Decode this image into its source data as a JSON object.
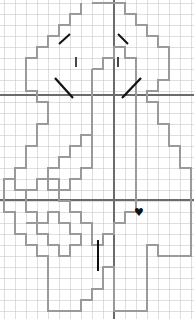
{
  "canvas": {
    "width": 194,
    "height": 319,
    "background": "#ffffff"
  },
  "grid": {
    "cell_size": 11,
    "origin_x": 4,
    "origin_y": 3,
    "minor_color": "#c9c9c9",
    "minor_width": 0.6,
    "major_color": "#6b6b6b",
    "major_width": 1.1,
    "major_vertical_x": 114,
    "major_horizontal_y": [
      95,
      200
    ]
  },
  "outline": {
    "name": "pixel-figure-outline",
    "stroke": "#9a9a9a",
    "stroke_width": 1.6,
    "fill": "none",
    "description": "blocky stair-stepped silhouette of a head, torso and legs",
    "points": "92,3 125,3 125,14 136,14 136,25 147,25 147,36 158,36 158,47 169,47 169,80 158,80 158,91 147,91 147,102 158,102 158,113 158,124 169,124 169,146 180,146 180,168 191,168 191,179 191,190 191,256 158,256 158,245 147,245 147,256 147,267 147,278 147,289 147,300 147,311 114,311 114,300 114,289 114,278 114,267 103,267 103,278 103,289 92,289 92,300 81,300 81,311 48,311 48,300 48,289 48,278 48,267 48,256 37,256 37,245 26,245 26,234 15,234 15,223 15,212 4,212 4,201 4,190 4,179 15,179 15,168 26,168 26,157 26,146 37,146 37,135 37,124 48,124 48,113 48,102 37,102 37,91 26,91 26,80 26,69 26,58 37,58 37,47 48,47 48,36 59,36 59,25 70,25 70,14 81,14 81,3"
  },
  "inner_shapes": [
    {
      "name": "inner-body-contour",
      "stroke": "#9a9a9a",
      "stroke_width": 1.4,
      "points": "92,69 103,69 103,58 114,58 114,47 125,47 125,58 136,58 136,69 136,80 136,91 136,113 136,135 136,157 136,179 136,201 136,212 125,212 125,223 114,223 114,234 103,234 103,245 92,245 92,223 81,223 81,212 70,212 70,201 59,201 59,190 48,190 48,179 37,179 37,190 26,190 26,201 26,212 37,212 37,223 48,223 48,212 59,212 59,223 70,223 70,234 81,234 81,245 70,245 70,256 59,256 59,245 48,245 48,234 37,234 37,223 26,223"
    },
    {
      "name": "inner-torso-left",
      "stroke": "#9a9a9a",
      "stroke_width": 1.4,
      "points": "92,69 92,91 92,113 92,135 92,157 92,168 81,168 81,179 70,179 70,190 59,190 59,179 48,179 48,168 59,168 59,157 70,157 70,146 81,146 81,135 92,135"
    },
    {
      "name": "inner-hip-step-left",
      "stroke": "#9a9a9a",
      "stroke_width": 1.4,
      "points": "15,179 15,190 26,190"
    }
  ],
  "marks": [
    {
      "name": "tick-diagonal-upper-left",
      "type": "line",
      "x1": 59,
      "y1": 44,
      "x2": 70,
      "y2": 34,
      "color": "#111111",
      "width": 2.0
    },
    {
      "name": "tick-diagonal-upper-right",
      "type": "line",
      "x1": 128,
      "y1": 44,
      "x2": 118,
      "y2": 34,
      "color": "#111111",
      "width": 2.0
    },
    {
      "name": "tick-vertical-left",
      "type": "line",
      "x1": 76,
      "y1": 57,
      "x2": 76,
      "y2": 67,
      "color": "#333333",
      "width": 1.8
    },
    {
      "name": "tick-vertical-right",
      "type": "line",
      "x1": 118,
      "y1": 57,
      "x2": 118,
      "y2": 67,
      "color": "#333333",
      "width": 1.8
    },
    {
      "name": "tick-diagonal-lower-left",
      "type": "line",
      "x1": 55,
      "y1": 78,
      "x2": 73,
      "y2": 98,
      "color": "#111111",
      "width": 2.2
    },
    {
      "name": "tick-diagonal-lower-right",
      "type": "line",
      "x1": 141,
      "y1": 78,
      "x2": 122,
      "y2": 98,
      "color": "#111111",
      "width": 2.2
    },
    {
      "name": "tick-vertical-bottom",
      "type": "line",
      "x1": 98,
      "y1": 240,
      "x2": 98,
      "y2": 271,
      "color": "#111111",
      "width": 2.0
    }
  ],
  "symbols": [
    {
      "name": "heart-icon",
      "glyph": "♥",
      "x": 139,
      "y": 212,
      "size": 11,
      "color": "#111111"
    }
  ],
  "labels": {
    "title": "",
    "caption": ""
  }
}
